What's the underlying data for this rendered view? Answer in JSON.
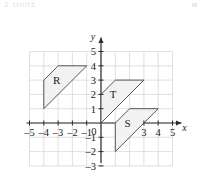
{
  "figure": {
    "header_text": "2  Units",
    "axis_labels": {
      "x": "x",
      "y": "y"
    },
    "origin_label": "0",
    "x_ticks": [
      {
        "value": -5,
        "label": "–5"
      },
      {
        "value": -4,
        "label": "–4"
      },
      {
        "value": -3,
        "label": "–3"
      },
      {
        "value": -2,
        "label": "–2"
      },
      {
        "value": -1,
        "label": "–1"
      },
      {
        "value": 3,
        "label": "3"
      },
      {
        "value": 4,
        "label": "4"
      },
      {
        "value": 5,
        "label": "5"
      }
    ],
    "y_ticks": [
      {
        "value": 5,
        "label": "5"
      },
      {
        "value": 4,
        "label": "4"
      },
      {
        "value": 3,
        "label": "3"
      },
      {
        "value": 2,
        "label": "2"
      },
      {
        "value": 1,
        "label": "1"
      },
      {
        "value": -1,
        "label": "–1"
      },
      {
        "value": -2,
        "label": "–2"
      },
      {
        "value": -3,
        "label": "–3"
      }
    ],
    "colors": {
      "grid": "#d8d8dd",
      "axis": "#2b2b2b",
      "shape_stroke": "#555555",
      "shape_fill": "#f2f2f2",
      "text": "#1a1a1a"
    }
  },
  "chart_data": {
    "type": "scatter",
    "title": "",
    "xlabel": "x",
    "ylabel": "y",
    "xlim": [
      -5,
      5
    ],
    "ylim": [
      -3,
      5
    ],
    "grid": true,
    "legend": "none",
    "xticks": [
      -5,
      -4,
      -3,
      -2,
      -1,
      0,
      3,
      4,
      5
    ],
    "yticks": [
      5,
      4,
      3,
      2,
      1,
      0,
      -1,
      -2,
      -3
    ],
    "shapes": [
      {
        "name": "R",
        "label": "R",
        "label_at": [
          -3.1,
          3.0
        ],
        "vertices": [
          [
            -4,
            1
          ],
          [
            -4,
            3
          ],
          [
            -3,
            4
          ],
          [
            -1,
            4
          ]
        ]
      },
      {
        "name": "T",
        "label": "T",
        "label_at": [
          0.85,
          2.0
        ],
        "vertices": [
          [
            0,
            0
          ],
          [
            0,
            2
          ],
          [
            1,
            3
          ],
          [
            3,
            3
          ]
        ]
      },
      {
        "name": "S",
        "label": "S",
        "label_at": [
          1.85,
          0.0
        ],
        "vertices": [
          [
            1,
            -2
          ],
          [
            1,
            0
          ],
          [
            2,
            1
          ],
          [
            4,
            1
          ]
        ]
      }
    ]
  }
}
